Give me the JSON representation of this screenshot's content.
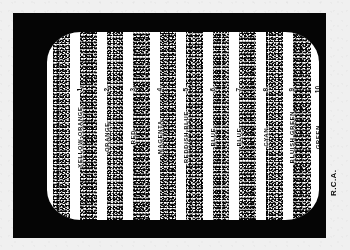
{
  "figure": {
    "kind": "crt-test-pattern-photo",
    "maker_credit": "R.C.A.",
    "background_color": "#ebebe9",
    "bezel_color": "#0b0b0b",
    "screen_color": "#fdfdfb",
    "bar_color": "#111111"
  },
  "chart_data": {
    "type": "bar",
    "xlabel": "",
    "ylabel": "",
    "categories": [
      "YELLOW-ORANGE",
      "ORANGE",
      "RED",
      "MAGENTA",
      "REDDISH BLUE",
      "BLUE",
      "BLUE",
      "CYAN",
      "BLUISH GREEN",
      "GREEN"
    ],
    "values": [
      1,
      2,
      3,
      4,
      5,
      6,
      7,
      8,
      9,
      10
    ],
    "legend": [],
    "grid": false
  },
  "bars": [
    {
      "index": "1",
      "name": "YELLOW-ORANGE",
      "left": 6,
      "width": 17
    },
    {
      "index": "2",
      "name": "ORANGE",
      "left": 33,
      "width": 17
    },
    {
      "index": "3",
      "name": "RED",
      "left": 60,
      "width": 16
    },
    {
      "index": "4",
      "name": "MAGENTA",
      "left": 86,
      "width": 17
    },
    {
      "index": "5",
      "name": "REDDISH BLUE",
      "left": 113,
      "width": 16
    },
    {
      "index": "6",
      "name": "BLUE",
      "left": 139,
      "width": 17
    },
    {
      "index": "7",
      "name": "BLUE",
      "left": 166,
      "width": 16
    },
    {
      "index": "8",
      "name": "CYAN",
      "left": 192,
      "width": 17
    },
    {
      "index": "9",
      "name": "BLUISH GREEN",
      "left": 219,
      "width": 17
    },
    {
      "index": "10",
      "name": "GREEN",
      "left": 246,
      "width": 18
    }
  ],
  "captions": [
    {
      "index": "1",
      "name": "YELLOW-ORANGE",
      "left": 24
    },
    {
      "index": "2",
      "name": "ORANGE",
      "left": 51
    },
    {
      "index": "3",
      "name": "RED",
      "left": 77
    },
    {
      "index": "4",
      "name": "MAGENTA",
      "left": 104
    },
    {
      "index": "5",
      "name": "REDDISH BLUE",
      "left": 130
    },
    {
      "index": "6",
      "name": "BLUE",
      "left": 157
    },
    {
      "index": "7",
      "name": "BLUE",
      "left": 183
    },
    {
      "index": "8",
      "name": "CYAN",
      "left": 210
    },
    {
      "index": "9",
      "name": "BLUISH GREEN",
      "left": 236
    },
    {
      "index": "10",
      "name": "GREEN",
      "left": 262
    }
  ]
}
